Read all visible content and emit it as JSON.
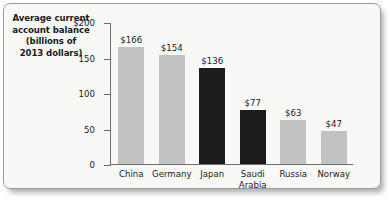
{
  "chart_data": {
    "type": "bar",
    "title": "Average current account balance (billions of 2013 dollars)",
    "title_lines": [
      "Average current",
      "account balance",
      "(billions of",
      "2013 dollars)"
    ],
    "xlabel": "",
    "ylabel": "Average current account balance (billions of 2013 dollars)",
    "ylim": [
      0,
      200
    ],
    "grid": false,
    "legend": "none",
    "categories": [
      "China",
      "Germany",
      "Japan",
      "Saudi Arabia",
      "Russia",
      "Norway"
    ],
    "category_lines": [
      [
        "China"
      ],
      [
        "Germany"
      ],
      [
        "Japan"
      ],
      [
        "Saudi",
        "Arabia"
      ],
      [
        "Russia"
      ],
      [
        "Norway"
      ]
    ],
    "values": [
      166,
      154,
      136,
      77,
      63,
      47
    ],
    "value_labels": [
      "$166",
      "$154",
      "$136",
      "$77",
      "$63",
      "$47"
    ],
    "bar_styles": [
      "light",
      "light",
      "dark",
      "dark",
      "light",
      "light"
    ],
    "yticks": [
      0,
      50,
      100,
      150,
      200
    ],
    "ytick_labels": [
      "0",
      "50",
      "100",
      "150",
      "$200"
    ],
    "colors": {
      "bar_light": "#c2c2c2",
      "bar_dark": "#1c1c1c",
      "axis": "#6e6e6e",
      "text": "#1b1b1b",
      "background": "#f8f8f7",
      "border": "#9b9b9b"
    }
  }
}
